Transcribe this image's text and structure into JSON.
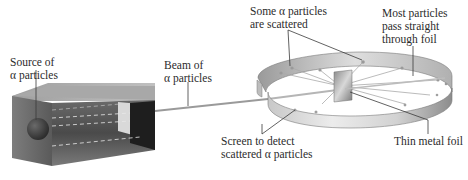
{
  "diagram": {
    "labels": {
      "source": {
        "line1": "Source of",
        "line2": "α particles"
      },
      "beam": {
        "line1": "Beam of",
        "line2": "α particles"
      },
      "scattered": {
        "line1": "Some α particles",
        "line2": "are scattered"
      },
      "most_pass": {
        "line1": "Most particles",
        "line2": "pass straight",
        "line3": "through foil"
      },
      "screen": {
        "line1": "Screen to detect",
        "line2": "scattered α particles"
      },
      "foil": {
        "line1": "Thin metal foil"
      }
    },
    "components": [
      "source-box",
      "alpha-source-sphere",
      "beam",
      "circular-detection-screen",
      "thin-metal-foil",
      "scattered-particle-tracks"
    ],
    "colors": {
      "text": "#2b2b2b",
      "leader_line": "#3a3a3a",
      "box_dark": "#3c3c3c",
      "box_light": "#9a9a9a",
      "screen_light": "#e6e6e6",
      "screen_dark": "#8a8a8a",
      "beam": "#9a9a9a"
    }
  }
}
